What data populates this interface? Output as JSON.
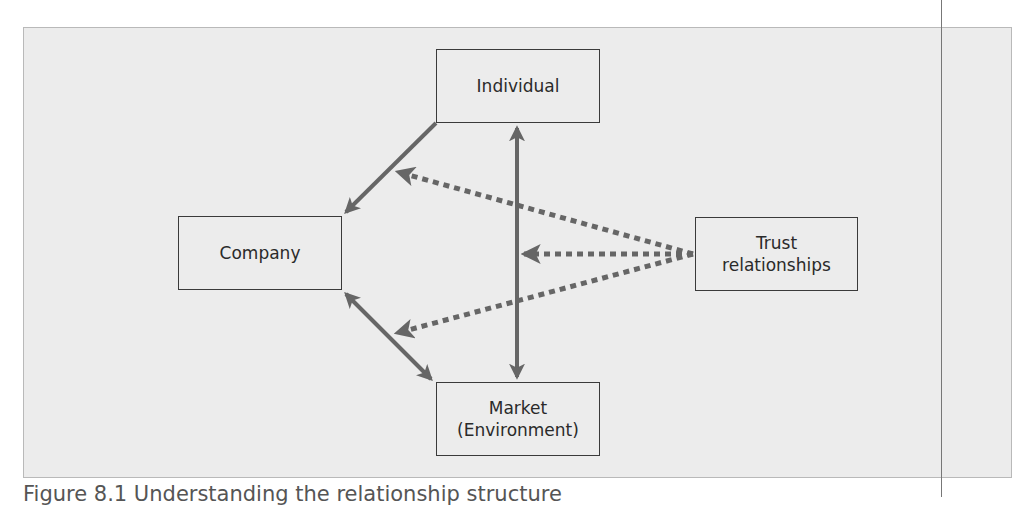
{
  "diagram": {
    "nodes": {
      "individual": {
        "label": "Individual"
      },
      "company": {
        "label": "Company"
      },
      "market": {
        "line1": "Market",
        "line2": "(Environment)"
      },
      "trust": {
        "line1": "Trust",
        "line2": "relationships"
      }
    },
    "edges": [
      {
        "from": "individual",
        "to": "company",
        "style": "solid",
        "direction": "forward"
      },
      {
        "from": "individual",
        "to": "market",
        "style": "solid",
        "direction": "both"
      },
      {
        "from": "company",
        "to": "market",
        "style": "solid",
        "direction": "both"
      },
      {
        "from": "trust",
        "to": "individual-company-edge",
        "style": "dotted",
        "direction": "forward"
      },
      {
        "from": "trust",
        "to": "individual-market-edge",
        "style": "dotted",
        "direction": "forward"
      },
      {
        "from": "trust",
        "to": "company-market-edge",
        "style": "dotted",
        "direction": "forward"
      }
    ],
    "colors": {
      "arrow": "#666666",
      "box_border": "#3a3a3a",
      "panel": "#ececec"
    }
  },
  "caption": "Figure 8.1 Understanding the relationship structure"
}
